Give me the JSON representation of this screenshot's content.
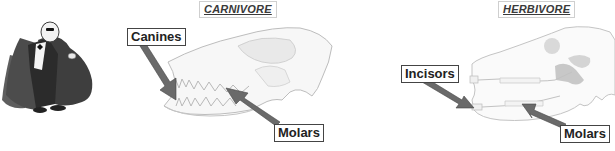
{
  "diagram": {
    "character": {
      "icon": "caped-vampire-figure"
    },
    "carnivore": {
      "title": "CARNIVORE",
      "labels": [
        {
          "text": "Canines"
        },
        {
          "text": "Molars"
        }
      ]
    },
    "herbivore": {
      "title": "HERBIVORE",
      "labels": [
        {
          "text": "Incisors"
        },
        {
          "text": "Molars"
        }
      ]
    },
    "colors": {
      "skull_line": "#bdbdbd",
      "skull_fill": "#e6e6e6",
      "arrow": "#5a5a5a",
      "label_border": "#444444",
      "cape": "#4a4a4a"
    }
  }
}
